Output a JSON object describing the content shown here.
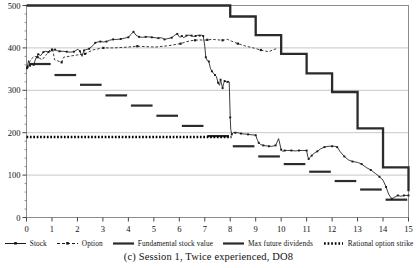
{
  "caption": "(c) Session 1, Twice experienced, DO8",
  "axes": {
    "y_ticks": [
      0,
      100,
      200,
      300,
      400,
      500
    ],
    "y_tick_labels": [
      "0",
      "100",
      "200",
      "300",
      "400",
      "500"
    ],
    "y_minor_step": 20,
    "x_ticks": [
      0,
      1,
      2,
      3,
      4,
      5,
      6,
      7,
      8,
      9,
      10,
      11,
      12,
      13,
      14,
      15
    ],
    "x_tick_labels": [
      "0",
      "1",
      "2",
      "3",
      "4",
      "5",
      "6",
      "7",
      "8",
      "9",
      "10",
      "11",
      "12",
      "13",
      "14",
      "15"
    ],
    "xlim": [
      0,
      15
    ],
    "ylim": [
      0,
      500
    ],
    "grid": "horizontal-major-only"
  },
  "legend": {
    "position": "below-axes",
    "items": [
      {
        "key": "line-marker",
        "label": "Stock",
        "color": "#1a1a1a"
      },
      {
        "key": "dashed-marker",
        "label": "Option",
        "color": "#1a1a1a"
      },
      {
        "key": "thick-line",
        "label": "Fundamental stock value",
        "color": "#2b2b2b"
      },
      {
        "key": "thick-line",
        "label": "Max future dividends",
        "color": "#2b2b2b"
      },
      {
        "key": "dotted-line",
        "label": "Rational option strike",
        "color": "#000000"
      }
    ]
  },
  "chart_data": {
    "type": "line",
    "title": "",
    "xlabel": "",
    "ylabel": "",
    "xlim": [
      0,
      15
    ],
    "ylim": [
      0,
      500
    ],
    "grid": true,
    "legend_position": "below",
    "series": [
      {
        "name": "Stock",
        "style": "solid-with-markers",
        "color": "#1a1a1a",
        "points": [
          [
            0.02,
            352
          ],
          [
            0.08,
            370
          ],
          [
            0.14,
            358
          ],
          [
            0.2,
            362
          ],
          [
            0.28,
            360
          ],
          [
            0.36,
            374
          ],
          [
            0.46,
            385
          ],
          [
            0.56,
            382
          ],
          [
            0.66,
            390
          ],
          [
            0.76,
            392
          ],
          [
            0.86,
            390
          ],
          [
            1.02,
            394
          ],
          [
            1.12,
            396
          ],
          [
            1.22,
            393
          ],
          [
            1.3,
            392
          ],
          [
            1.44,
            392
          ],
          [
            1.58,
            391
          ],
          [
            1.72,
            390
          ],
          [
            1.86,
            391
          ],
          [
            2.02,
            397
          ],
          [
            2.1,
            392
          ],
          [
            2.18,
            380
          ],
          [
            2.26,
            394
          ],
          [
            2.34,
            396
          ],
          [
            2.46,
            398
          ],
          [
            2.6,
            405
          ],
          [
            2.7,
            412
          ],
          [
            2.8,
            414
          ],
          [
            2.9,
            415
          ],
          [
            3.02,
            414
          ],
          [
            3.14,
            415
          ],
          [
            3.26,
            418
          ],
          [
            3.4,
            420
          ],
          [
            3.55,
            420
          ],
          [
            3.7,
            421
          ],
          [
            3.85,
            423
          ],
          [
            4.0,
            425
          ],
          [
            4.1,
            432
          ],
          [
            4.2,
            438
          ],
          [
            4.3,
            430
          ],
          [
            4.42,
            426
          ],
          [
            4.55,
            425
          ],
          [
            4.68,
            426
          ],
          [
            4.8,
            426
          ],
          [
            4.92,
            425
          ],
          [
            5.05,
            424
          ],
          [
            5.18,
            423
          ],
          [
            5.3,
            424
          ],
          [
            5.42,
            420
          ],
          [
            5.55,
            422
          ],
          [
            5.7,
            424
          ],
          [
            5.82,
            430
          ],
          [
            5.92,
            433
          ],
          [
            6.02,
            425
          ],
          [
            6.1,
            428
          ],
          [
            6.18,
            424
          ],
          [
            6.28,
            429
          ],
          [
            6.38,
            430
          ],
          [
            6.48,
            429
          ],
          [
            6.56,
            427
          ],
          [
            6.64,
            428
          ],
          [
            6.72,
            430
          ],
          [
            6.8,
            429
          ],
          [
            6.88,
            430
          ],
          [
            6.94,
            428
          ],
          [
            7.0,
            404
          ],
          [
            7.04,
            378
          ],
          [
            7.1,
            370
          ],
          [
            7.16,
            368
          ],
          [
            7.22,
            352
          ],
          [
            7.28,
            345
          ],
          [
            7.34,
            340
          ],
          [
            7.4,
            336
          ],
          [
            7.46,
            332
          ],
          [
            7.52,
            318
          ],
          [
            7.58,
            312
          ],
          [
            7.62,
            325
          ],
          [
            7.66,
            315
          ],
          [
            7.7,
            305
          ],
          [
            7.74,
            316
          ],
          [
            7.78,
            322
          ],
          [
            7.84,
            320
          ],
          [
            7.9,
            320
          ],
          [
            7.96,
            320
          ],
          [
            8.0,
            236
          ],
          [
            8.02,
            208
          ],
          [
            8.06,
            196
          ],
          [
            8.12,
            200
          ],
          [
            8.2,
            200
          ],
          [
            8.3,
            200
          ],
          [
            8.42,
            198
          ],
          [
            8.55,
            197
          ],
          [
            8.7,
            196
          ],
          [
            8.85,
            195
          ],
          [
            9.0,
            194
          ],
          [
            9.06,
            184
          ],
          [
            9.12,
            176
          ],
          [
            9.2,
            172
          ],
          [
            9.3,
            170
          ],
          [
            9.4,
            169
          ],
          [
            9.52,
            168
          ],
          [
            9.64,
            168
          ],
          [
            9.78,
            170
          ],
          [
            9.9,
            186
          ],
          [
            10.0,
            160
          ],
          [
            10.06,
            156
          ],
          [
            10.14,
            158
          ],
          [
            10.26,
            158
          ],
          [
            10.4,
            158
          ],
          [
            10.55,
            157
          ],
          [
            10.7,
            158
          ],
          [
            10.84,
            158
          ],
          [
            11.0,
            158
          ],
          [
            11.04,
            145
          ],
          [
            11.08,
            138
          ],
          [
            11.14,
            142
          ],
          [
            11.2,
            146
          ],
          [
            11.3,
            152
          ],
          [
            11.42,
            156
          ],
          [
            11.55,
            162
          ],
          [
            11.7,
            166
          ],
          [
            11.84,
            168
          ],
          [
            12.0,
            168
          ],
          [
            12.1,
            168
          ],
          [
            12.2,
            166
          ],
          [
            12.32,
            155
          ],
          [
            12.48,
            144
          ],
          [
            12.64,
            136
          ],
          [
            12.8,
            132
          ],
          [
            13.0,
            130
          ],
          [
            13.16,
            126
          ],
          [
            13.34,
            118
          ],
          [
            13.52,
            112
          ],
          [
            13.7,
            104
          ],
          [
            13.86,
            96
          ],
          [
            14.0,
            88
          ],
          [
            14.12,
            72
          ],
          [
            14.22,
            55
          ],
          [
            14.34,
            44
          ],
          [
            14.46,
            48
          ],
          [
            14.58,
            52
          ],
          [
            14.7,
            50
          ],
          [
            14.82,
            52
          ],
          [
            14.94,
            52
          ],
          [
            15.0,
            52
          ]
        ]
      },
      {
        "name": "Option",
        "style": "dashed-with-markers",
        "color": "#1a1a1a",
        "points": [
          [
            0.04,
            355
          ],
          [
            0.16,
            372
          ],
          [
            0.3,
            380
          ],
          [
            0.44,
            378
          ],
          [
            0.62,
            372
          ],
          [
            0.92,
            395
          ],
          [
            1.0,
            396
          ],
          [
            1.05,
            390
          ],
          [
            1.1,
            372
          ],
          [
            1.38,
            366
          ],
          [
            1.46,
            378
          ],
          [
            1.95,
            383
          ],
          [
            2.3,
            386
          ],
          [
            2.6,
            395
          ],
          [
            2.92,
            399
          ],
          [
            3.02,
            400
          ],
          [
            3.45,
            400
          ],
          [
            4.0,
            402
          ],
          [
            4.35,
            404
          ],
          [
            5.05,
            402
          ],
          [
            5.55,
            405
          ],
          [
            6.05,
            410
          ],
          [
            6.25,
            414
          ],
          [
            6.45,
            417
          ],
          [
            6.62,
            418
          ],
          [
            6.8,
            419
          ],
          [
            6.95,
            418
          ],
          [
            7.1,
            419
          ],
          [
            7.3,
            420
          ],
          [
            7.52,
            419
          ],
          [
            7.7,
            418
          ],
          [
            7.9,
            420
          ],
          [
            8.05,
            416
          ],
          [
            8.3,
            410
          ],
          [
            8.62,
            404
          ],
          [
            8.9,
            400
          ],
          [
            9.2,
            395
          ],
          [
            9.5,
            391
          ],
          [
            9.8,
            398
          ]
        ]
      }
    ],
    "step_series": [
      {
        "name": "Max future dividends",
        "style": "thick-step",
        "color": "#2b2b2b",
        "steps": [
          [
            0.0,
            1.0,
            500
          ],
          [
            1.0,
            2.0,
            500
          ],
          [
            2.0,
            3.0,
            500
          ],
          [
            3.0,
            4.0,
            500
          ],
          [
            4.0,
            5.0,
            500
          ],
          [
            5.0,
            6.0,
            500
          ],
          [
            6.0,
            7.0,
            500
          ],
          [
            7.0,
            8.0,
            500
          ],
          [
            8.0,
            9.0,
            474
          ],
          [
            9.0,
            10.0,
            430
          ],
          [
            10.0,
            11.0,
            386
          ],
          [
            11.0,
            12.0,
            340
          ],
          [
            12.0,
            13.0,
            296
          ],
          [
            13.0,
            14.0,
            210
          ],
          [
            14.0,
            15.0,
            118
          ],
          [
            15.0,
            15.0,
            62
          ]
        ],
        "note": "flat at 500 through period 8, then descending staircase"
      },
      {
        "name": "Fundamental stock value",
        "style": "thick-segments",
        "color": "#2b2b2b",
        "segments": [
          [
            0.1,
            0.95,
            362
          ],
          [
            1.1,
            1.95,
            336
          ],
          [
            2.1,
            2.95,
            313
          ],
          [
            3.1,
            3.95,
            288
          ],
          [
            4.1,
            4.95,
            264
          ],
          [
            5.1,
            5.95,
            240
          ],
          [
            6.1,
            6.95,
            216
          ],
          [
            7.1,
            7.95,
            192
          ],
          [
            8.1,
            8.95,
            168
          ],
          [
            9.1,
            9.95,
            144
          ],
          [
            10.1,
            10.95,
            126
          ],
          [
            11.1,
            11.95,
            108
          ],
          [
            12.1,
            12.95,
            86
          ],
          [
            13.1,
            13.95,
            66
          ],
          [
            14.1,
            14.95,
            42
          ]
        ]
      }
    ],
    "reference_lines": [
      {
        "name": "Rational option strike",
        "style": "dotted",
        "color": "#000000",
        "y": 190,
        "x_from": 0.0,
        "x_to": 8.05
      }
    ]
  }
}
